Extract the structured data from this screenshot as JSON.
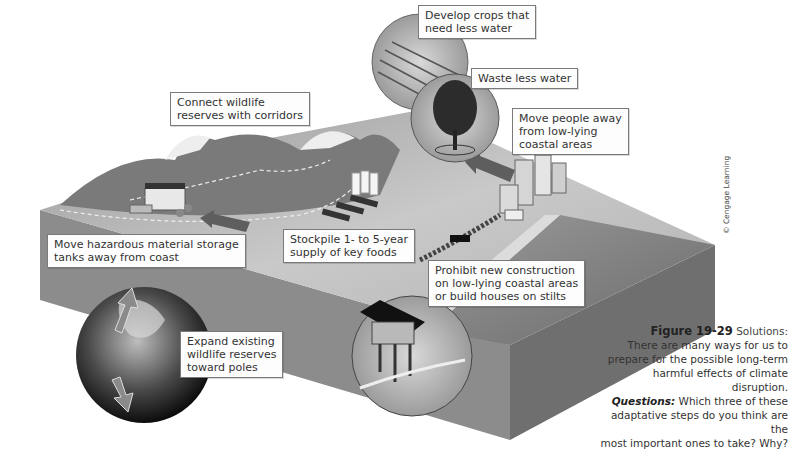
{
  "figure": {
    "number": "Figure 19-29",
    "title": "Solutions:",
    "description_lines": [
      "There are many ways for us to",
      "prepare for the possible long-term",
      "harmful effects of climate disruption."
    ],
    "questions_label": "Questions:",
    "question_lines": [
      "Which three of these",
      "adaptative steps do you think are the",
      "most important ones to take? Why?"
    ],
    "credit": "© Cengage Learning"
  },
  "callouts": [
    {
      "id": "crops",
      "lines": [
        "Develop crops that",
        "need less water"
      ]
    },
    {
      "id": "waste-water",
      "lines": [
        "Waste less water"
      ]
    },
    {
      "id": "move-people",
      "lines": [
        "Move people away",
        "from low-lying",
        "coastal areas"
      ]
    },
    {
      "id": "corridors",
      "lines": [
        "Connect wildlife",
        "reserves with corridors"
      ]
    },
    {
      "id": "hazardous",
      "lines": [
        "Move hazardous material storage",
        "tanks away from coast"
      ]
    },
    {
      "id": "stockpile",
      "lines": [
        "Stockpile 1- to 5-year",
        "supply of key foods"
      ]
    },
    {
      "id": "prohibit",
      "lines": [
        "Prohibit new construction",
        "on low-lying coastal areas",
        "or build houses on stilts"
      ]
    },
    {
      "id": "expand",
      "lines": [
        "Expand existing",
        "wildlife reserves",
        "toward poles"
      ]
    }
  ],
  "colors": {
    "land_top": "#b8b8b8",
    "land_side": "#8a8a8a",
    "ocean": "#7d7d7d",
    "label_border": "#7a7a7a",
    "arrow": "#6e6e6e"
  }
}
